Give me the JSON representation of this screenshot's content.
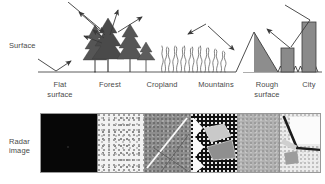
{
  "figure": {
    "row_labels": {
      "surface": "Surface",
      "radar_line1": "Radar",
      "radar_line2": "image"
    }
  },
  "columns": [
    {
      "id": "flat-surface",
      "caption_line1": "Flat",
      "caption_line2": "surface",
      "scatter_mechanism": "specular reflection",
      "radar_tone": "black",
      "radar_tone_hex": "#070707",
      "radar_description": "very dark, no return"
    },
    {
      "id": "forest",
      "caption_line1": "Forest",
      "caption_line2": "",
      "scatter_mechanism": "volume scattering",
      "radar_tone": "bright mottled",
      "radar_tone_hex": "#f2f2f2",
      "radar_description": "bright speckled texture"
    },
    {
      "id": "cropland",
      "caption_line1": "Cropland",
      "caption_line2": "",
      "scatter_mechanism": "diffuse scattering",
      "radar_tone": "medium grey",
      "radar_tone_hex": "#8e8e8e",
      "radar_description": "grey fields with bright linear feature"
    },
    {
      "id": "mountains",
      "caption_line1": "Mountains",
      "caption_line2": "",
      "scatter_mechanism": "layover and shadow",
      "radar_tone": "dark with bright slopes",
      "radar_tone_hex": "#121212",
      "radar_description": "bright facing slopes, dark radar shadow"
    },
    {
      "id": "rough-surface",
      "caption_line1": "Rough",
      "caption_line2": "surface",
      "scatter_mechanism": "diffuse backscatter",
      "radar_tone": "uniform grey",
      "radar_tone_hex": "#b2b2b2",
      "radar_description": "even medium grey tone"
    },
    {
      "id": "city",
      "caption_line1": "City",
      "caption_line2": "",
      "scatter_mechanism": "double bounce corner reflection",
      "radar_tone": "very bright",
      "radar_tone_hex": "#ececec",
      "radar_description": "bright returns with dark street lines"
    }
  ],
  "colors": {
    "ink": "#3a3a3a",
    "line": "#4a4a4a",
    "frame": "#9a9a9a",
    "fill_dark": "#707070",
    "fill_mid": "#8a8a8a",
    "background": "#ffffff"
  }
}
